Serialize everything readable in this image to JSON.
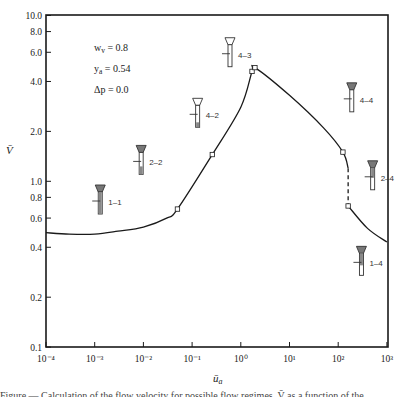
{
  "chart_data": {
    "type": "line",
    "title": "",
    "xlabel": "ū_a",
    "ylabel": "V̄",
    "xscale": "log",
    "yscale": "log",
    "xlim": [
      0.0001,
      1000
    ],
    "ylim": [
      0.1,
      10.0
    ],
    "grid": false,
    "x_ticks": [
      "10⁻⁴",
      "10⁻³",
      "10⁻²",
      "10⁻¹",
      "10⁰",
      "10¹",
      "10²",
      "10³"
    ],
    "x_tick_values": [
      0.0001,
      0.001,
      0.01,
      0.1,
      1,
      10,
      100,
      1000
    ],
    "y_ticks": [
      "10.0",
      "8.0",
      "6.0",
      "4.0",
      "2.0",
      "1.0",
      "0.8",
      "0.6",
      "0.4",
      "0.2",
      "0.1"
    ],
    "y_tick_values": [
      10.0,
      8.0,
      6.0,
      4.0,
      2.0,
      1.0,
      0.8,
      0.6,
      0.4,
      0.2,
      0.1
    ],
    "parameters": [
      {
        "name": "w_v",
        "value": "0.8",
        "text": "w_v = 0.8"
      },
      {
        "name": "y_a",
        "value": "0.54",
        "text": "y_a = 0.54"
      },
      {
        "name": "Δp",
        "value": "0.0",
        "text": "Δp = 0.0"
      }
    ],
    "series": [
      {
        "name": "V̄ vs ū_a",
        "style": "solid",
        "x": [
          0.0001,
          0.0003,
          0.001,
          0.003,
          0.01,
          0.03,
          0.05,
          0.26,
          1.0,
          1.7,
          1.95,
          10,
          50,
          125,
          160
        ],
        "y": [
          0.49,
          0.48,
          0.48,
          0.5,
          0.53,
          0.6,
          0.68,
          1.45,
          2.8,
          4.6,
          4.85,
          3.3,
          2.1,
          1.5,
          1.2
        ]
      },
      {
        "name": "transition (dashed)",
        "style": "dashed",
        "x": [
          160,
          160
        ],
        "y": [
          1.2,
          0.71
        ]
      },
      {
        "name": "V̄ vs ū_a (continued)",
        "style": "solid",
        "x": [
          160,
          400,
          1000
        ],
        "y": [
          0.71,
          0.52,
          0.43
        ]
      }
    ],
    "markers": [
      {
        "x": 0.05,
        "y": 0.68
      },
      {
        "x": 0.26,
        "y": 1.45
      },
      {
        "x": 1.7,
        "y": 4.6
      },
      {
        "x": 1.95,
        "y": 4.85
      },
      {
        "x": 125,
        "y": 1.5
      },
      {
        "x": 160,
        "y": 0.71
      }
    ],
    "annotations": [
      {
        "label": "1–1",
        "x": 0.0013,
        "y": 0.75,
        "icon": "flow-regime-icon",
        "fill": "hatched-full"
      },
      {
        "label": "2–2",
        "x": 0.009,
        "y": 1.3,
        "icon": "flow-regime-icon",
        "fill": "hatched-half"
      },
      {
        "label": "4–2",
        "x": 0.13,
        "y": 2.5,
        "icon": "flow-regime-icon",
        "fill": "bottom-only"
      },
      {
        "label": "4–3",
        "x": 0.6,
        "y": 5.8,
        "icon": "flow-regime-icon",
        "fill": "empty"
      },
      {
        "label": "4–4",
        "x": 190,
        "y": 3.1,
        "icon": "flow-regime-icon",
        "fill": "top-cap"
      },
      {
        "label": "2–4",
        "x": 510,
        "y": 1.05,
        "icon": "flow-regime-icon",
        "fill": "top-cap-half"
      },
      {
        "label": "1–4",
        "x": 300,
        "y": 0.32,
        "icon": "flow-regime-icon",
        "fill": "top-cap-hatched"
      }
    ]
  },
  "axes": {
    "x_title": "ū",
    "x_title_sub": "a",
    "y_title": "V̄"
  },
  "caption": {
    "text_partial": "Figure — Calculation of the flow velocity for possible flow regimes. V̄ as a function of the ..."
  }
}
